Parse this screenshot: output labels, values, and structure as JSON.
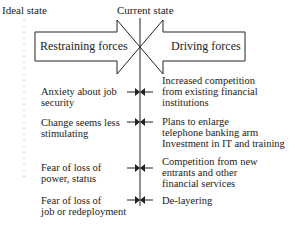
{
  "diagram": {
    "type": "force-field-analysis",
    "headers": {
      "ideal_state": "Ideal state",
      "current_state": "Current state"
    },
    "arrows": {
      "restraining": "Restraining forces",
      "driving": "Driving forces"
    },
    "restraining_forces": [
      {
        "line1": "Anxiety about job",
        "line2": "security"
      },
      {
        "line1": "Change seems less",
        "line2": "stimulating"
      },
      {
        "line1": "Fear of loss of",
        "line2": "power, status"
      },
      {
        "line1": "Fear of loss of",
        "line2": "job or redeployment"
      }
    ],
    "driving_forces": [
      {
        "line1": "Increased competition",
        "line2": "from existing financial",
        "line3": "institutions"
      },
      {
        "line1": "Plans to enlarge",
        "line2": "telephone banking arm",
        "line3": "Investment in IT and training"
      },
      {
        "line1": "Competition from new",
        "line2": "entrants and other",
        "line3": "financial services"
      },
      {
        "line1": "De-layering"
      }
    ],
    "colors": {
      "stroke": "#222222",
      "dotted": "#999999",
      "background": "#ffffff"
    }
  }
}
